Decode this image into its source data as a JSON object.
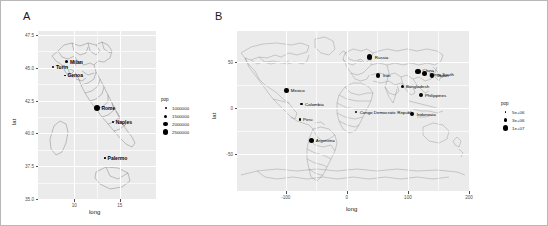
{
  "figure": {
    "background": "#ffffff",
    "border_color": "#b8b8b8",
    "panel_fill": "#ebebeb",
    "grid_color": "#ffffff",
    "point_color": "#000000"
  },
  "panels": [
    {
      "letter": "A",
      "axis": {
        "xlabel": "long",
        "ylabel": "lat",
        "xticks": [
          "10",
          "15"
        ],
        "xtick_values": [
          10,
          15
        ],
        "yticks": [
          "47.5",
          "45.0",
          "42.5",
          "40.0",
          "37.5",
          "35.0"
        ],
        "ytick_values": [
          47.5,
          45.0,
          42.5,
          40.0,
          37.5,
          35.0
        ],
        "xlim": [
          6.0,
          19.0
        ],
        "ylim": [
          35.0,
          47.8
        ]
      },
      "legend": {
        "title": "pop",
        "entries": [
          {
            "label": "1000000",
            "size": 2.0
          },
          {
            "label": "1500000",
            "size": 3.0
          },
          {
            "label": "2000000",
            "size": 4.4
          },
          {
            "label": "2500000",
            "size": 5.8
          }
        ]
      },
      "cities": [
        {
          "name": "Milan",
          "long": 9.19,
          "lat": 45.46,
          "pop": 1350000,
          "size": 3.0,
          "label_dx": 3.0,
          "label_dy": 0.0
        },
        {
          "name": "Turin",
          "long": 7.69,
          "lat": 45.07,
          "pop": 880000,
          "size": 1.9,
          "label_dx": 2.6,
          "label_dy": 0.0
        },
        {
          "name": "Genoa",
          "long": 8.95,
          "lat": 44.41,
          "pop": 580000,
          "size": 1.6,
          "label_dx": 2.6,
          "label_dy": 0.0
        },
        {
          "name": "Rome",
          "long": 12.5,
          "lat": 41.9,
          "pop": 2870000,
          "size": 6.0,
          "label_dx": 4.4,
          "label_dy": 0.0
        },
        {
          "name": "Naples",
          "long": 14.25,
          "lat": 40.84,
          "pop": 970000,
          "size": 2.1,
          "label_dx": 2.8,
          "label_dy": 0.0
        },
        {
          "name": "Palermo",
          "long": 13.36,
          "lat": 38.12,
          "pop": 670000,
          "size": 1.7,
          "label_dx": 2.8,
          "label_dy": 0.0
        }
      ]
    },
    {
      "letter": "B",
      "axis": {
        "xlabel": "long",
        "ylabel": "lat",
        "xticks": [
          "-100",
          "0",
          "100",
          "200"
        ],
        "xtick_values": [
          -100,
          0,
          100,
          200
        ],
        "yticks": [
          "50",
          "0",
          "-50"
        ],
        "ytick_values": [
          50,
          0,
          -50
        ],
        "xlim": [
          -180,
          200
        ],
        "ylim": [
          -90,
          84
        ]
      },
      "legend": {
        "title": "pop",
        "entries": [
          {
            "label": "5e+06",
            "size": 1.8
          },
          {
            "label": "3e+06",
            "size": 3.3
          },
          {
            "label": "1e+07",
            "size": 5.2
          }
        ]
      },
      "cities": [
        {
          "name": "Russia",
          "long": 37.6,
          "lat": 55.8,
          "pop": 10500000,
          "size": 5.2,
          "label_dx": 5.0,
          "label_dy": 0.0
        },
        {
          "name": "Iran",
          "long": 51.4,
          "lat": 35.7,
          "pop": 7800000,
          "size": 4.4,
          "label_dx": 4.6,
          "label_dy": 0.0
        },
        {
          "name": "China",
          "long": 116.4,
          "lat": 39.9,
          "pop": 11000000,
          "size": 5.2,
          "label_dx": 4.6,
          "label_dy": -1.5
        },
        {
          "name": "Korea South",
          "long": 127.0,
          "lat": 37.6,
          "pop": 9700000,
          "size": 5.0,
          "label_dx": 5.0,
          "label_dy": 0.0
        },
        {
          "name": "Japan",
          "long": 139.7,
          "lat": 35.7,
          "pop": 8300000,
          "size": 4.6,
          "label_dx": 4.6,
          "label_dy": 0.0
        },
        {
          "name": "Bangladesh",
          "long": 90.4,
          "lat": 23.7,
          "pop": 6900000,
          "size": 3.0,
          "label_dx": 3.8,
          "label_dy": 0.0
        },
        {
          "name": "Philippines",
          "long": 121.0,
          "lat": 14.6,
          "pop": 7100000,
          "size": 4.0,
          "label_dx": 4.2,
          "label_dy": 0.0
        },
        {
          "name": "Indonesia",
          "long": 106.8,
          "lat": -6.2,
          "pop": 8800000,
          "size": 4.8,
          "label_dx": 4.6,
          "label_dy": 0.0
        },
        {
          "name": "Congo Democratic Republic",
          "long": 15.3,
          "lat": -4.3,
          "pop": 5400000,
          "size": 2.4,
          "label_dx": 3.4,
          "label_dy": 0.0
        },
        {
          "name": "Mexico",
          "long": -99.1,
          "lat": 19.4,
          "pop": 9200000,
          "size": 4.6,
          "label_dx": 4.4,
          "label_dy": 0.0
        },
        {
          "name": "Colombia",
          "long": -74.1,
          "lat": 4.6,
          "pop": 6300000,
          "size": 2.8,
          "label_dx": 3.4,
          "label_dy": 0.0
        },
        {
          "name": "Peru",
          "long": -77.0,
          "lat": -12.0,
          "pop": 6000000,
          "size": 2.6,
          "label_dx": 3.2,
          "label_dy": 0.0
        },
        {
          "name": "Argentina",
          "long": -58.4,
          "lat": -34.6,
          "pop": 10000000,
          "size": 5.0,
          "label_dx": 4.6,
          "label_dy": 0.0
        }
      ]
    }
  ]
}
